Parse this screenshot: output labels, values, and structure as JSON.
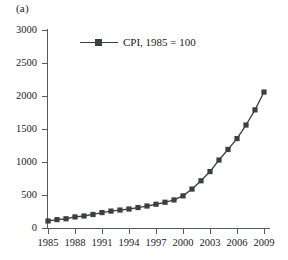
{
  "figure": {
    "panel_label": "(a)",
    "background": "#ffffff",
    "axis_color": "#555a5e",
    "series_color": "#3b3f43"
  },
  "legend": {
    "position": "top-left-inside",
    "marker": "filled-square",
    "entries": [
      {
        "label": "CPI, 1985 = 100",
        "color": "#3b3f43"
      }
    ]
  },
  "chart_data": {
    "type": "line",
    "title": "",
    "subtitle": "",
    "xlabel": "",
    "ylabel": "",
    "xlim": [
      1985,
      2009
    ],
    "ylim": [
      0,
      3000
    ],
    "grid": false,
    "legend_position": "upper left (inside axes)",
    "y_ticks": [
      0,
      500,
      1000,
      1500,
      2000,
      2500,
      3000
    ],
    "y_tick_labels": [
      "0",
      "500",
      "1000",
      "1500",
      "2000",
      "2500",
      "3000"
    ],
    "x_ticks": [
      1985,
      1988,
      1991,
      1994,
      1997,
      2000,
      2003,
      2006,
      2009
    ],
    "x_tick_labels": [
      "1985",
      "1988",
      "1991",
      "1994",
      "1997",
      "2000",
      "2003",
      "2006",
      "2009"
    ],
    "x": [
      1985,
      1986,
      1987,
      1988,
      1989,
      1990,
      1991,
      1992,
      1993,
      1994,
      1995,
      1996,
      1997,
      1998,
      1999,
      2000,
      2001,
      2002,
      2003,
      2004,
      2005,
      2006,
      2007,
      2008,
      2009
    ],
    "series": [
      {
        "name": "CPI, 1985 = 100",
        "marker": "filled-square",
        "color": "#3b3f43",
        "values": [
          106,
          127,
          140,
          168,
          182,
          205,
          234,
          256,
          272,
          288,
          310,
          333,
          360,
          390,
          425,
          487,
          590,
          715,
          855,
          1030,
          1190,
          1355,
          1560,
          1790,
          2060
        ]
      }
    ],
    "annotations": [
      {
        "text": "(a)",
        "position": "top-left outside axes"
      }
    ]
  }
}
